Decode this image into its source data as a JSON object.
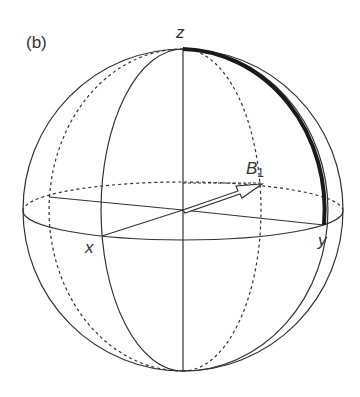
{
  "figure": {
    "panel_label": "(b)",
    "axes": {
      "z": "z",
      "x": "x",
      "y": "y"
    },
    "vector": {
      "name": "B",
      "subscript": "1"
    },
    "colors": {
      "line": "#333333",
      "thick_arc": "#1a1a1a",
      "background": "#ffffff"
    }
  }
}
